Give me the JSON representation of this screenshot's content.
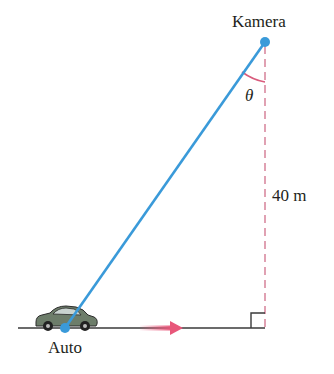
{
  "diagram": {
    "labels": {
      "camera": "Kamera",
      "car": "Auto",
      "angle": "θ",
      "height": "40 m"
    },
    "colors": {
      "sightline": "#3a9ad9",
      "dashed_line": "#d98aa0",
      "angle_arc": "#d95b7c",
      "ground": "#3a3a3a",
      "motion_arrow": "#e8577a",
      "text": "#231f20"
    },
    "points": {
      "camera": [
        265,
        42
      ],
      "car": [
        65,
        328
      ],
      "foot": [
        265,
        328
      ]
    }
  }
}
